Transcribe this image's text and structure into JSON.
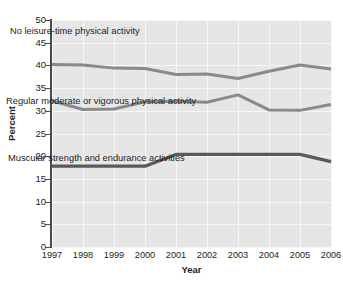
{
  "chart_data": {
    "type": "line",
    "title": "",
    "xlabel": "Year",
    "ylabel": "Percent",
    "categories": [
      "1997",
      "1998",
      "1999",
      "2000",
      "2001",
      "2002",
      "2003",
      "2004",
      "2005",
      "2006"
    ],
    "x": [
      1997,
      1998,
      1999,
      2000,
      2001,
      2002,
      2003,
      2004,
      2005,
      2006
    ],
    "ylim": [
      0,
      50
    ],
    "yticks": [
      0,
      5,
      10,
      15,
      20,
      25,
      30,
      35,
      40,
      45,
      50
    ],
    "grid": true,
    "legend_position": "inline-labels",
    "series": [
      {
        "name": "No leisure-time physical activity",
        "color": "#8a8a8a",
        "values": [
          40.2,
          40.1,
          39.4,
          39.3,
          38.0,
          38.1,
          37.1,
          38.7,
          40.1,
          39.2
        ]
      },
      {
        "name": "Regular moderate or vigorous physical activity",
        "color": "#8a8a8a",
        "values": [
          32.2,
          30.3,
          30.4,
          32.0,
          32.1,
          31.9,
          33.5,
          30.2,
          30.1,
          31.4
        ]
      },
      {
        "name": "Muscular strength and endurance activities",
        "color": "#5a5a5a",
        "values": [
          17.8,
          17.8,
          17.8,
          17.8,
          20.4,
          20.4,
          20.4,
          20.4,
          20.4,
          18.8
        ]
      }
    ],
    "annotations": [
      "No leisure-time physical activity",
      "Regular moderate or vigorous physical activity",
      "Muscular strength and endurance activities"
    ]
  },
  "axes": {
    "y_title": "Percent",
    "x_title": "Year",
    "y_tick_labels": [
      "50",
      "45",
      "40",
      "35",
      "30",
      "25",
      "20",
      "15",
      "10",
      "5",
      "0"
    ],
    "x_tick_labels": [
      "1997",
      "1998",
      "1999",
      "2000",
      "2001",
      "2002",
      "2003",
      "2004",
      "2005",
      "2006"
    ]
  },
  "colors": {
    "plot_background": "#e6e6e6",
    "gridline": "#f7f7f7",
    "axis": "#4a4a4a",
    "text": "#1d1d1d",
    "series_light": "#8a8a8a",
    "series_dark": "#5a5a5a"
  }
}
